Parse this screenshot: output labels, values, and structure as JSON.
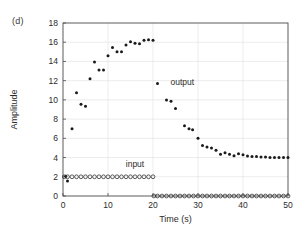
{
  "figure": {
    "panel_label": "(d)"
  },
  "chart_data": {
    "type": "scatter",
    "title": "",
    "xlabel": "Time (s)",
    "ylabel": "Amplitude",
    "xlim": [
      0,
      50
    ],
    "ylim": [
      0,
      18
    ],
    "xticks": [
      0,
      10,
      20,
      30,
      40,
      50
    ],
    "yticks": [
      0,
      2,
      4,
      6,
      8,
      10,
      12,
      14,
      16,
      18
    ],
    "xticklabels": [
      "0",
      "10",
      "20",
      "30",
      "40",
      "50"
    ],
    "yticklabels": [
      "0",
      "2",
      "4",
      "6",
      "8",
      "10",
      "12",
      "14",
      "16",
      "18"
    ],
    "grid": true,
    "legend_position": "inline-annotation",
    "annotations": [
      {
        "text": "output",
        "x": 26.5,
        "y": 11.6
      },
      {
        "text": "input",
        "x": 16.0,
        "y": 3.0
      }
    ],
    "series": [
      {
        "name": "output",
        "marker": "filled-circle",
        "color": "#1a1a1a",
        "points": [
          [
            0.6,
            2.05
          ],
          [
            1.0,
            1.55
          ],
          [
            2.0,
            7.0
          ],
          [
            3.0,
            10.75
          ],
          [
            4.0,
            9.55
          ],
          [
            5.0,
            9.35
          ],
          [
            6.0,
            12.2
          ],
          [
            7.0,
            13.95
          ],
          [
            8.0,
            13.1
          ],
          [
            9.0,
            13.1
          ],
          [
            10.0,
            14.6
          ],
          [
            11.0,
            15.45
          ],
          [
            12.0,
            15.0
          ],
          [
            13.0,
            15.0
          ],
          [
            14.0,
            15.7
          ],
          [
            15.0,
            16.05
          ],
          [
            16.0,
            15.9
          ],
          [
            17.0,
            15.85
          ],
          [
            18.0,
            16.2
          ],
          [
            19.0,
            16.25
          ],
          [
            20.0,
            16.2
          ],
          [
            21.0,
            11.7
          ],
          [
            23.0,
            10.0
          ],
          [
            24.0,
            9.85
          ],
          [
            25.0,
            9.1
          ],
          [
            27.0,
            7.3
          ],
          [
            28.0,
            7.0
          ],
          [
            28.8,
            6.9
          ],
          [
            30.0,
            6.0
          ],
          [
            31.0,
            5.25
          ],
          [
            32.0,
            5.1
          ],
          [
            33.0,
            5.0
          ],
          [
            34.0,
            4.75
          ],
          [
            35.0,
            4.35
          ],
          [
            36.0,
            4.5
          ],
          [
            37.0,
            4.35
          ],
          [
            38.0,
            4.2
          ],
          [
            39.0,
            4.4
          ],
          [
            40.0,
            4.3
          ],
          [
            41.0,
            4.15
          ],
          [
            42.0,
            4.1
          ],
          [
            43.0,
            4.1
          ],
          [
            44.0,
            4.05
          ],
          [
            45.0,
            4.05
          ],
          [
            46.0,
            4.0
          ],
          [
            47.0,
            4.0
          ],
          [
            48.0,
            4.0
          ],
          [
            49.0,
            4.0
          ],
          [
            50.0,
            4.0
          ]
        ]
      },
      {
        "name": "input",
        "marker": "open-circle",
        "color": "#2a2a2a",
        "points": [
          [
            0.3,
            2.0
          ],
          [
            1.0,
            2.0
          ],
          [
            2.0,
            2.0
          ],
          [
            3.0,
            2.0
          ],
          [
            4.0,
            2.0
          ],
          [
            5.0,
            2.0
          ],
          [
            6.0,
            2.0
          ],
          [
            7.0,
            2.0
          ],
          [
            8.0,
            2.0
          ],
          [
            9.0,
            2.0
          ],
          [
            10.0,
            2.0
          ],
          [
            11.0,
            2.0
          ],
          [
            12.0,
            2.0
          ],
          [
            13.0,
            2.0
          ],
          [
            14.0,
            2.0
          ],
          [
            15.0,
            2.0
          ],
          [
            16.0,
            2.0
          ],
          [
            17.0,
            2.0
          ],
          [
            18.0,
            2.0
          ],
          [
            19.0,
            2.0
          ],
          [
            20.0,
            2.0
          ],
          [
            20.2,
            0.0
          ],
          [
            21.0,
            0.0
          ],
          [
            22.0,
            0.0
          ],
          [
            23.0,
            0.0
          ],
          [
            24.0,
            0.0
          ],
          [
            25.0,
            0.0
          ],
          [
            26.0,
            0.0
          ],
          [
            27.0,
            0.0
          ],
          [
            28.0,
            0.0
          ],
          [
            29.0,
            0.0
          ],
          [
            30.0,
            0.0
          ],
          [
            31.0,
            0.0
          ],
          [
            32.0,
            0.0
          ],
          [
            33.0,
            0.0
          ],
          [
            34.0,
            0.0
          ],
          [
            35.0,
            0.0
          ],
          [
            36.0,
            0.0
          ],
          [
            37.0,
            0.0
          ],
          [
            38.0,
            0.0
          ],
          [
            39.0,
            0.0
          ],
          [
            40.0,
            0.0
          ],
          [
            41.0,
            0.0
          ],
          [
            42.0,
            0.0
          ],
          [
            43.0,
            0.0
          ],
          [
            44.0,
            0.0
          ],
          [
            45.0,
            0.0
          ],
          [
            46.0,
            0.0
          ],
          [
            47.0,
            0.0
          ],
          [
            48.0,
            0.0
          ],
          [
            49.0,
            0.0
          ],
          [
            50.0,
            0.0
          ]
        ]
      }
    ]
  }
}
